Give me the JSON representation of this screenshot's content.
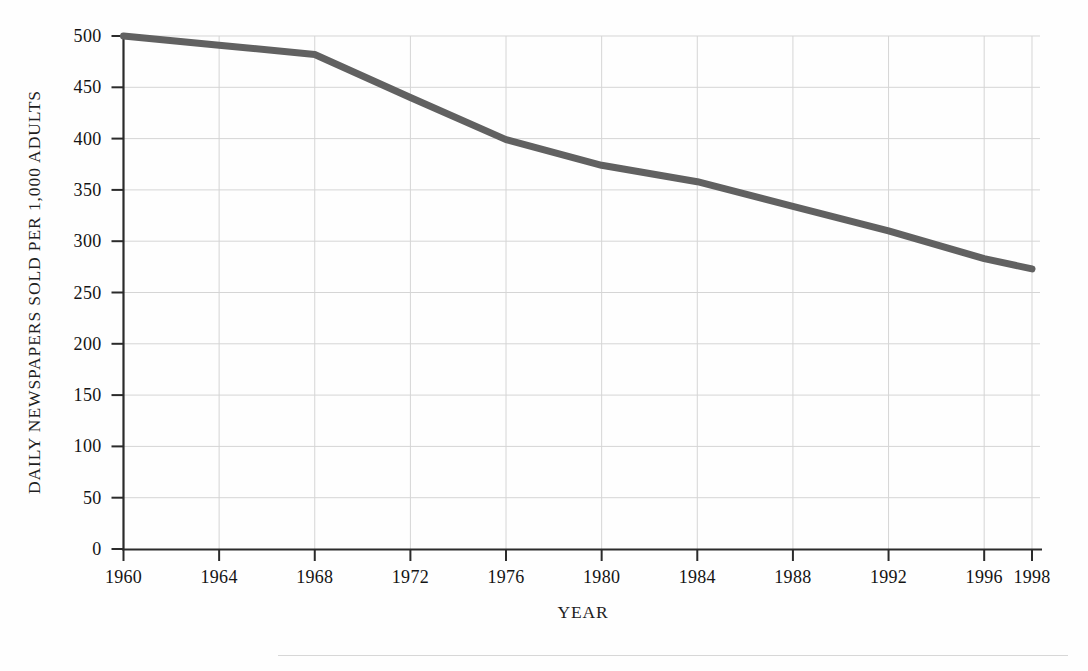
{
  "chart_data": {
    "type": "line",
    "title": "",
    "subtitle": "",
    "xlabel": "YEAR",
    "ylabel": "DAILY NEWSPAPERS SOLD PER 1,000 ADULTS",
    "x": [
      1960,
      1964,
      1968,
      1972,
      1976,
      1980,
      1984,
      1988,
      1992,
      1996,
      1998
    ],
    "values": [
      500,
      491,
      482,
      440,
      399,
      374,
      358,
      334,
      310,
      283,
      273
    ],
    "series": [
      {
        "name": "Daily newspapers sold per 1,000 adults",
        "values": [
          500,
          491,
          482,
          440,
          399,
          374,
          358,
          334,
          310,
          283,
          273
        ]
      }
    ],
    "categories": [
      "1960",
      "1964",
      "1968",
      "1972",
      "1976",
      "1980",
      "1984",
      "1988",
      "1992",
      "1996",
      "1998"
    ],
    "xlim": [
      1960,
      1998
    ],
    "ylim": [
      0,
      500
    ],
    "ytick_labels": [
      "0",
      "50",
      "100",
      "150",
      "200",
      "250",
      "300",
      "350",
      "400",
      "450",
      "500"
    ],
    "ytick_values": [
      0,
      50,
      100,
      150,
      200,
      250,
      300,
      350,
      400,
      450,
      500
    ],
    "xtick_labels": [
      "1960",
      "1964",
      "1968",
      "1972",
      "1976",
      "1980",
      "1984",
      "1988",
      "1992",
      "1996",
      "1998"
    ],
    "xtick_values": [
      1960,
      1964,
      1968,
      1972,
      1976,
      1980,
      1984,
      1988,
      1992,
      1996,
      1998
    ],
    "grid": true,
    "grid_color": "#d5d5d5",
    "legend": false,
    "legend_position": "none",
    "line_color": "#616161",
    "line_width": 7,
    "axis_color": "#2b2b2b",
    "background_color": "#fefefe",
    "annotations": []
  },
  "figure": {
    "top_remnant_text": "",
    "footer_rule_visible": true
  }
}
